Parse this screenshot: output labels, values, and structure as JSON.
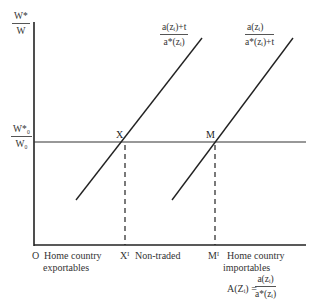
{
  "axes": {
    "y_label_num": "W*",
    "y_label_den": "W",
    "ref_label_num": "W*₀",
    "ref_label_den": "W₀",
    "origin": "O"
  },
  "curves": [
    {
      "name": "curve-left",
      "label_num": "a(zᵢ)+t",
      "label_den": "a*(zᵢ)"
    },
    {
      "name": "curve-right",
      "label_num": "a(zᵢ)",
      "label_den": "a*(zᵢ)+t"
    }
  ],
  "points": {
    "x": "X",
    "m": "M",
    "x_prime": "Xᴵ",
    "m_prime": "Mᴵ"
  },
  "regions": {
    "exportables": "Home country\nexportables",
    "exportables_line1": "Home country",
    "exportables_line2": "exportables",
    "non_traded": "Non-traded",
    "importables_line1": "Home country",
    "importables_line2": "importables"
  },
  "formula": {
    "lhs": "A(Zᵢ) =",
    "num": "a(zᵢ)",
    "den": "a*(zᵢ)"
  },
  "colors": {
    "line": "#222222",
    "text": "#333333",
    "background": "#ffffff"
  }
}
